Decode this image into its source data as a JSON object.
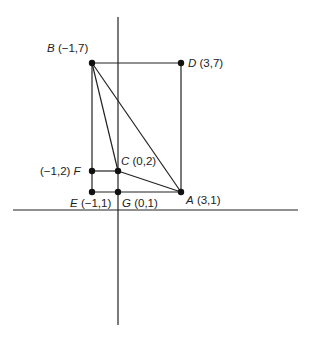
{
  "diagram": {
    "type": "coordinate-geometry",
    "axes": {
      "x_axis": {
        "x1": 13,
        "x2": 298,
        "y": 210
      },
      "y_axis": {
        "x": 118,
        "y1": 17,
        "y2": 325
      }
    },
    "points": [
      {
        "id": "B",
        "letter": "B",
        "coords": "(−1,7)",
        "px": 92,
        "py": 63
      },
      {
        "id": "D",
        "letter": "D",
        "coords": "(3,7)",
        "px": 181,
        "py": 63
      },
      {
        "id": "F",
        "letter": "F",
        "coords": "(−1,2)",
        "px": 92,
        "py": 171
      },
      {
        "id": "C",
        "letter": "C",
        "coords": "(0,2)",
        "px": 118,
        "py": 171
      },
      {
        "id": "E",
        "letter": "E",
        "coords": "(−1,1)",
        "px": 92,
        "py": 192
      },
      {
        "id": "G",
        "letter": "G",
        "coords": "(0,1)",
        "px": 118,
        "py": 192
      },
      {
        "id": "A",
        "letter": "A",
        "coords": "(3,1)",
        "px": 181,
        "py": 192
      }
    ],
    "labels": {
      "B": {
        "letter": "B",
        "coords": "(−1,7)"
      },
      "D": {
        "letter": "D",
        "coords": "(3,7)"
      },
      "F": {
        "letter": "F",
        "coords": "(−1,2)"
      },
      "C": {
        "letter": "C",
        "coords": "(0,2)"
      },
      "E": {
        "letter": "E",
        "coords": "(−1,1)"
      },
      "G": {
        "letter": "G",
        "coords": "(0,1)"
      },
      "A": {
        "letter": "A",
        "coords": "(3,1)"
      }
    },
    "segments": [
      [
        "B",
        "D"
      ],
      [
        "D",
        "A"
      ],
      [
        "B",
        "E"
      ],
      [
        "E",
        "A"
      ],
      [
        "B",
        "A"
      ],
      [
        "B",
        "C"
      ],
      [
        "C",
        "A"
      ],
      [
        "F",
        "C"
      ],
      [
        "C",
        "G"
      ]
    ]
  }
}
